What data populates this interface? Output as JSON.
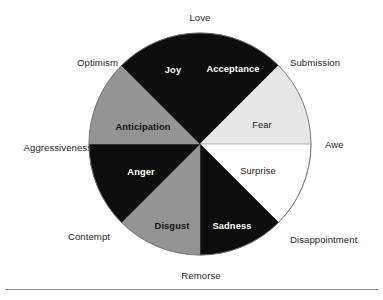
{
  "figure": {
    "name": "plutchik-wheel-of-emotions",
    "accent_colors": {
      "black": "#0d0d0d",
      "mid_gray": "#949494",
      "light_gray": "#e6e6e6",
      "white": "#ffffff",
      "outline": "#6e6e6e",
      "rule": "#8d8d92"
    },
    "geometry": {
      "center_x": 200,
      "center_y": 144,
      "radius": 111
    }
  },
  "chart_data": {
    "type": "pie",
    "title": "",
    "legend_position": "none",
    "grid": false,
    "categories": [
      "Acceptance",
      "Fear",
      "Surprise",
      "Sadness",
      "Disgust",
      "Anger",
      "Anticipation",
      "Joy"
    ],
    "values": [
      12.5,
      12.5,
      12.5,
      12.5,
      12.5,
      12.5,
      12.5,
      12.5
    ],
    "slices": [
      {
        "label": "Acceptance",
        "start_deg": 0,
        "end_deg": 45,
        "fill": "#0d0d0d",
        "text_color": "#ffffff",
        "bold": true,
        "label_x": 233,
        "label_y": 72
      },
      {
        "label": "Fear",
        "start_deg": 45,
        "end_deg": 90,
        "fill": "#e6e6e6",
        "text_color": "#111111",
        "bold": false,
        "label_x": 262,
        "label_y": 128
      },
      {
        "label": "Surprise",
        "start_deg": 90,
        "end_deg": 135,
        "fill": "#ffffff",
        "text_color": "#111111",
        "bold": false,
        "label_x": 258,
        "label_y": 174
      },
      {
        "label": "Sadness",
        "start_deg": 135,
        "end_deg": 180,
        "fill": "#0d0d0d",
        "text_color": "#ffffff",
        "bold": true,
        "label_x": 232,
        "label_y": 229
      },
      {
        "label": "Disgust",
        "start_deg": 180,
        "end_deg": 225,
        "fill": "#949494",
        "text_color": "#111111",
        "bold": true,
        "label_x": 172,
        "label_y": 229
      },
      {
        "label": "Anger",
        "start_deg": 225,
        "end_deg": 270,
        "fill": "#0d0d0d",
        "text_color": "#ffffff",
        "bold": true,
        "label_x": 141,
        "label_y": 175
      },
      {
        "label": "Anticipation",
        "start_deg": 270,
        "end_deg": 315,
        "fill": "#949494",
        "text_color": "#111111",
        "bold": true,
        "label_x": 143,
        "label_y": 130
      },
      {
        "label": "Joy",
        "start_deg": 315,
        "end_deg": 360,
        "fill": "#0d0d0d",
        "text_color": "#ffffff",
        "bold": true,
        "label_x": 173,
        "label_y": 73
      }
    ],
    "outer_labels": [
      {
        "label": "Love",
        "angle_deg": 0,
        "x": 200,
        "y": 21,
        "anchor": "middle"
      },
      {
        "label": "Submission",
        "angle_deg": 45,
        "x": 290,
        "y": 66,
        "anchor": "start"
      },
      {
        "label": "Awe",
        "angle_deg": 90,
        "x": 325,
        "y": 148,
        "anchor": "start"
      },
      {
        "label": "Disappointment",
        "angle_deg": 135,
        "x": 290,
        "y": 243,
        "anchor": "start"
      },
      {
        "label": "Remorse",
        "angle_deg": 180,
        "x": 201,
        "y": 279,
        "anchor": "middle"
      },
      {
        "label": "Contempt",
        "angle_deg": 225,
        "x": 110,
        "y": 240,
        "anchor": "end"
      },
      {
        "label": "Aggressiveness",
        "angle_deg": 270,
        "x": 92,
        "y": 151,
        "anchor": "end"
      },
      {
        "label": "Optimism",
        "angle_deg": 315,
        "x": 118,
        "y": 66,
        "anchor": "end"
      }
    ]
  },
  "footer": {
    "divider": "horizontal-rule"
  }
}
